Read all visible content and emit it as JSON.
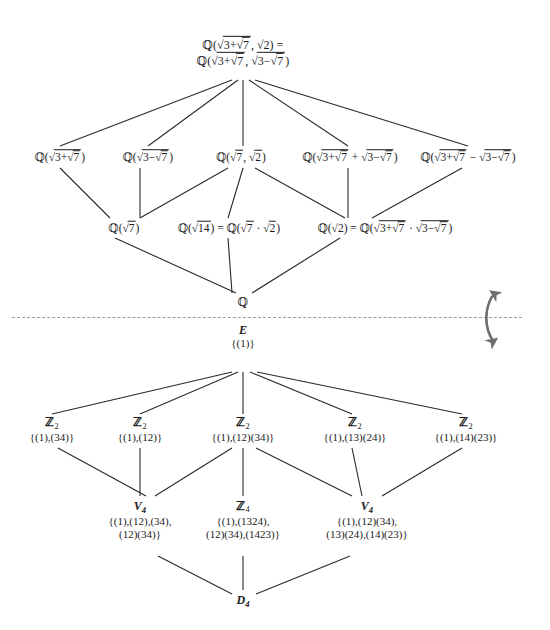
{
  "diagram": {
    "divider_label": "dashed-separator",
    "arrow_label": "galois-correspondence-arrow"
  },
  "field_lattice": {
    "top": {
      "line1": "ℚ(√(3+√7), √2) =",
      "line2": "ℚ(√(3+√7), √(3−√7))"
    },
    "row2": [
      {
        "label": "ℚ(√(3+√7))"
      },
      {
        "label": "ℚ(√(3−√7))"
      },
      {
        "label": "ℚ(√7, √2)"
      },
      {
        "label": "ℚ(√(3+√7) + √(3−√7))"
      },
      {
        "label": "ℚ(√(3+√7) − √(3−√7))"
      }
    ],
    "row3": [
      {
        "label": "ℚ(√7)"
      },
      {
        "label": "ℚ(√14) = ℚ(√7 · √2)"
      },
      {
        "label": "ℚ(√2) = ℚ(√(3+√7) · √(3−√7))"
      }
    ],
    "bottom": {
      "label": "ℚ"
    }
  },
  "group_lattice": {
    "top": {
      "name": "E",
      "elements": "{(1)}"
    },
    "row2": [
      {
        "name": "ℤ",
        "sub": "2",
        "elements": "{(1),(34)}"
      },
      {
        "name": "ℤ",
        "sub": "2",
        "elements": "{(1),(12)}"
      },
      {
        "name": "ℤ",
        "sub": "2",
        "elements": "{(1),(12)(34)}"
      },
      {
        "name": "ℤ",
        "sub": "2",
        "elements": "{(1),(13)(24)}"
      },
      {
        "name": "ℤ",
        "sub": "2",
        "elements": "{(1),(14)(23)}"
      }
    ],
    "row3": [
      {
        "name": "V",
        "sub": "4",
        "line1": "{(1),(12),(34),",
        "line2": "(12)(34)}"
      },
      {
        "name": "ℤ",
        "sub": "4",
        "line1": "{(1),(1324),",
        "line2": "(12)(34),(1423)}"
      },
      {
        "name": "V",
        "sub": "4",
        "line1": "{(1),(12)(34),",
        "line2": "(13)(24),(14)(23)}"
      }
    ],
    "bottom": {
      "name": "D",
      "sub": "4"
    }
  },
  "colors": {
    "ink": "#1b1b1b",
    "edge": "#2a2a2a",
    "divider": "#9a9a9a",
    "arrow": "#6f6f6f"
  }
}
